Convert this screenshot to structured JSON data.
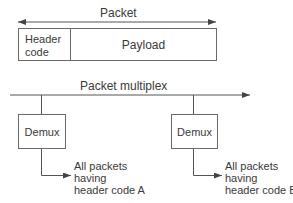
{
  "packet": {
    "title": "Packet",
    "header_line1": "Header",
    "header_line2": "code",
    "payload": "Payload"
  },
  "multiplex": {
    "title": "Packet multiplex"
  },
  "demuxes": [
    {
      "label": "Demux",
      "output_line1": "All packets",
      "output_line2": "having",
      "output_line3": "header code A"
    },
    {
      "label": "Demux",
      "output_line1": "All packets",
      "output_line2": "having",
      "output_line3": "header code B"
    }
  ],
  "colors": {
    "line": "#555555",
    "text": "#3a3a3a",
    "background": "#ffffff"
  }
}
